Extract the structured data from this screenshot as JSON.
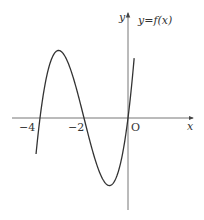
{
  "chart_data": {
    "type": "line",
    "title": "",
    "curve_label": "y=f(x)",
    "xlabel": "x",
    "ylabel": "y",
    "origin_label": "O",
    "x_tick_labels": [
      "−4",
      "−2"
    ],
    "x_ticks": [
      -4,
      -2
    ],
    "xlim": [
      -5.2,
      3.0
    ],
    "grid": false,
    "legend": "none",
    "function": "f(x) = k·x(x+2)(x+4), k>0",
    "roots": [
      -4,
      -2,
      0
    ],
    "local_max": {
      "x": -3.15,
      "y": 3.08
    },
    "local_min": {
      "x": -0.85,
      "y": -3.08
    },
    "series": [
      {
        "name": "y=f(x)",
        "x": [
          -4.18,
          -4.0,
          -3.8,
          -3.6,
          -3.4,
          -3.2,
          -3.0,
          -2.8,
          -2.6,
          -2.4,
          -2.2,
          -2.0,
          -1.8,
          -1.6,
          -1.4,
          -1.2,
          -1.0,
          -0.8,
          -0.6,
          -0.4,
          -0.2,
          0.0,
          0.2,
          0.28
        ],
        "y": [
          -2.0,
          0.0,
          1.64,
          2.59,
          3.0,
          3.07,
          2.89,
          2.43,
          1.84,
          1.25,
          0.62,
          0.0,
          -0.62,
          -1.25,
          -1.84,
          -2.43,
          -2.89,
          -3.07,
          -3.0,
          -2.59,
          -1.64,
          0.0,
          2.36,
          4.16
        ]
      }
    ],
    "colors": {
      "axis": "#555555",
      "curve": "#333333",
      "text": "#333333"
    }
  }
}
